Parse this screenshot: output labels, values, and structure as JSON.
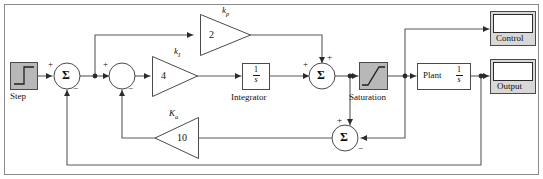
{
  "diagram": {
    "type": "block-diagram",
    "background": "#ffffff",
    "line_color": "#4a4a4a",
    "border_color": "#6b6b6b",
    "block_fill_gray": "#b8b8b8",
    "block_fill_white": "#ffffff"
  },
  "blocks": {
    "step": {
      "label": "Step",
      "kind": "source"
    },
    "sum1": {
      "symbol": "Σ",
      "signs": {
        "in_left": "+",
        "in_bottom": "−"
      }
    },
    "junction2": {
      "symbol": "",
      "signs": {
        "in_left": "+",
        "in_bottom": "−"
      }
    },
    "gain_kp": {
      "name": "k",
      "name_sub": "p",
      "value": "2"
    },
    "gain_ki": {
      "name": "k",
      "name_sub": "I",
      "value": "4"
    },
    "gain_ka": {
      "name": "K",
      "name_sub": "a",
      "value": "10"
    },
    "integrator": {
      "label": "Integrator",
      "numerator": "1",
      "denominator": "s"
    },
    "sum2": {
      "symbol": "Σ",
      "signs": {
        "in_left": "+",
        "in_top": "+"
      }
    },
    "saturation": {
      "label": "Saturation"
    },
    "sum3": {
      "symbol": "Σ",
      "signs": {
        "in_top": "+",
        "in_right": "−"
      }
    },
    "plant": {
      "label": "Plant",
      "numerator": "1",
      "denominator": "s"
    },
    "scope_control": {
      "label": "Control"
    },
    "scope_output": {
      "label": "Output"
    }
  }
}
